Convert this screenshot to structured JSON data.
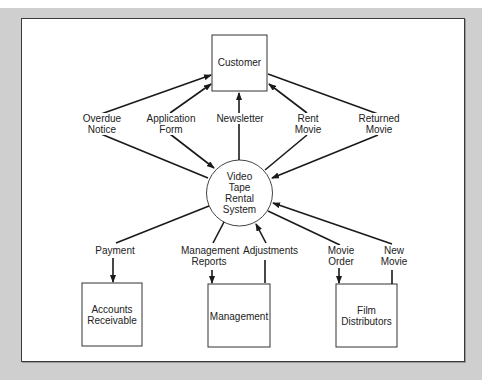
{
  "diagram": {
    "type": "context-level data flow diagram",
    "process": {
      "id": "video-tape-rental-system",
      "label_lines": [
        "Video",
        "Tape",
        "Rental",
        "System"
      ]
    },
    "entities": [
      {
        "id": "customer",
        "label_lines": [
          "Customer"
        ]
      },
      {
        "id": "accounts-receivable",
        "label_lines": [
          "Accounts",
          "Receivable"
        ]
      },
      {
        "id": "management",
        "label_lines": [
          "Management"
        ]
      },
      {
        "id": "film-distributors",
        "label_lines": [
          "Film",
          "Distributors"
        ]
      }
    ],
    "flows": [
      {
        "id": "overdue-notice",
        "label_lines": [
          "Overdue",
          "Notice"
        ],
        "from": "video-tape-rental-system",
        "to": "customer"
      },
      {
        "id": "application-form",
        "label_lines": [
          "Application",
          "Form"
        ],
        "from": "customer",
        "to": "video-tape-rental-system"
      },
      {
        "id": "newsletter",
        "label_lines": [
          "Newsletter"
        ],
        "from": "video-tape-rental-system",
        "to": "customer"
      },
      {
        "id": "rent-movie",
        "label_lines": [
          "Rent",
          "Movie"
        ],
        "from": "video-tape-rental-system",
        "to": "customer"
      },
      {
        "id": "returned-movie",
        "label_lines": [
          "Returned",
          "Movie"
        ],
        "from": "customer",
        "to": "video-tape-rental-system"
      },
      {
        "id": "payment",
        "label_lines": [
          "Payment"
        ],
        "from": "video-tape-rental-system",
        "to": "accounts-receivable"
      },
      {
        "id": "management-reports",
        "label_lines": [
          "Management",
          "Reports"
        ],
        "from": "video-tape-rental-system",
        "to": "management"
      },
      {
        "id": "adjustments",
        "label_lines": [
          "Adjustments"
        ],
        "from": "management",
        "to": "video-tape-rental-system"
      },
      {
        "id": "movie-order",
        "label_lines": [
          "Movie",
          "Order"
        ],
        "from": "video-tape-rental-system",
        "to": "film-distributors"
      },
      {
        "id": "new-movie",
        "label_lines": [
          "New",
          "Movie"
        ],
        "from": "film-distributors",
        "to": "video-tape-rental-system"
      }
    ]
  },
  "labels": {
    "customer": "Customer",
    "process_1": "Video",
    "process_2": "Tape",
    "process_3": "Rental",
    "process_4": "System",
    "overdue_1": "Overdue",
    "overdue_2": "Notice",
    "appform_1": "Application",
    "appform_2": "Form",
    "newsletter": "Newsletter",
    "rent_1": "Rent",
    "rent_2": "Movie",
    "returned_1": "Returned",
    "returned_2": "Movie",
    "payment": "Payment",
    "mgmtreports_1": "Management",
    "mgmtreports_2": "Reports",
    "adjustments": "Adjustments",
    "movieorder_1": "Movie",
    "movieorder_2": "Order",
    "newmovie_1": "New",
    "newmovie_2": "Movie",
    "ar_1": "Accounts",
    "ar_2": "Receivable",
    "management": "Management",
    "fd_1": "Film",
    "fd_2": "Distributors"
  },
  "colors": {
    "backdrop": "#cfcfcf",
    "frame_fill": "#ffffff",
    "stroke": "#1a1a1a",
    "text": "#222222"
  }
}
